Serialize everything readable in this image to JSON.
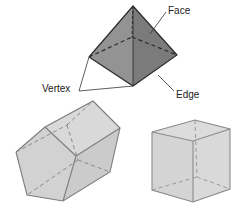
{
  "labels": {
    "face": "Face",
    "vertex": "Vertex",
    "edge": "Edge"
  },
  "colors": {
    "pyramid_left": "#8f8f8f",
    "pyramid_right": "#7a7a7a",
    "prism_face": "#d3d3d3",
    "prism_side": "#c6c6c6",
    "cube_face": "#d6d6d6",
    "edge": "#333333",
    "light_edge": "#8a8a8a"
  },
  "shapes": [
    "triangular-pyramid",
    "pentagonal-prism",
    "cube"
  ]
}
